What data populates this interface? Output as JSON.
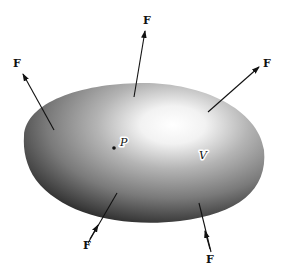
{
  "diagram": {
    "body": {
      "label": "V",
      "shading": "radial gray gradient with white highlight upper-right",
      "colors": {
        "highlight": "#ffffff",
        "mid": "#9a9a9a",
        "edge": "#2a2a2a"
      }
    },
    "point": {
      "label": "P"
    },
    "forces": [
      {
        "id": "upper-left",
        "label": "F",
        "direction": "outward"
      },
      {
        "id": "top",
        "label": "F",
        "direction": "outward"
      },
      {
        "id": "upper-right",
        "label": "F",
        "direction": "outward"
      },
      {
        "id": "bottom-left",
        "label": "F",
        "direction": "inward"
      },
      {
        "id": "bottom-right",
        "label": "F",
        "direction": "inward"
      }
    ]
  }
}
